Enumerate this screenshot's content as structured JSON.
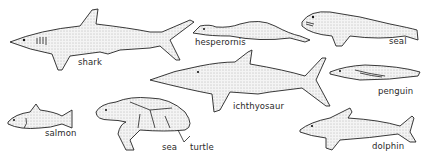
{
  "figure": {
    "animals": [
      {
        "id": "shark",
        "label": "shark"
      },
      {
        "id": "hesperornis",
        "label": "hesperornis"
      },
      {
        "id": "seal",
        "label": "seal"
      },
      {
        "id": "ichthyosaur",
        "label": "ichthyosaur"
      },
      {
        "id": "penguin",
        "label": "penguin"
      },
      {
        "id": "salmon",
        "label": "salmon"
      },
      {
        "id": "sea-turtle",
        "label_part1": "sea",
        "label_part2": "turtle"
      },
      {
        "id": "dolphin",
        "label": "dolphin"
      }
    ]
  }
}
